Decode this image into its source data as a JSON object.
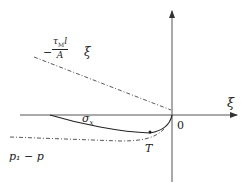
{
  "diagram": {
    "axes": {
      "x_label": "ξ",
      "origin_label": "0"
    },
    "curves": [
      {
        "name": "shear-line",
        "style": "dash-dot",
        "label_minus": "−",
        "label_num": "τ",
        "label_num_sub": "M",
        "label_num_tail": "l",
        "label_den": "A",
        "label_tail": "ξ"
      },
      {
        "name": "sigma-x-curve",
        "style": "solid",
        "label": "σ",
        "label_sub": "x"
      },
      {
        "name": "pressure-curve",
        "style": "dash-dot",
        "label": "p₁ − p"
      }
    ],
    "points": [
      {
        "name": "T",
        "label": "T"
      }
    ]
  }
}
